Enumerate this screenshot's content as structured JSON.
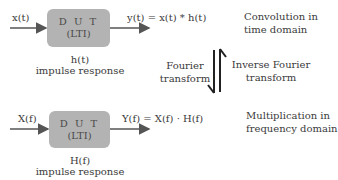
{
  "time_domain": {
    "input_label": "x(t)",
    "box_line1": "D U T",
    "box_line2": "(LTI)",
    "output_label": "y(t) = x(t) * h(t)",
    "response_symbol": "h(t)",
    "response_label": "impulse response",
    "description_line1": "Convolution in",
    "description_line2": "time domain"
  },
  "transforms": {
    "forward_line1": "Fourier",
    "forward_line2": "transform",
    "inverse_line1": "Inverse Fourier",
    "inverse_line2": "transform"
  },
  "frequency_domain": {
    "input_label": "X(f)",
    "box_line1": "D U T",
    "box_line2": "(LTI)",
    "output_label": "Y(f) = X(f) · H(f)",
    "response_symbol": "H(f)",
    "response_label": "impulse response",
    "description_line1": "Multiplication in",
    "description_line2": "frequency domain"
  },
  "colors": {
    "box_fill": "#b3b3b3",
    "arrow": "#555555",
    "text": "#3a3a3a"
  }
}
